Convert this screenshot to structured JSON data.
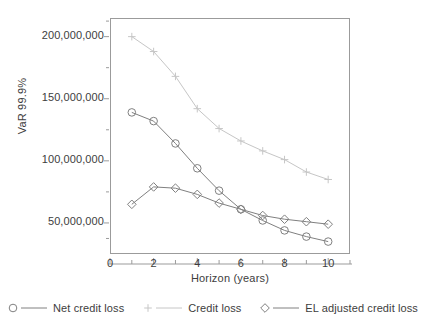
{
  "chart_data": {
    "type": "line",
    "title": "",
    "xlabel": "Horizon (years)",
    "ylabel": "VaR 99.9%",
    "x": [
      1,
      2,
      3,
      4,
      5,
      6,
      7,
      8,
      9,
      10
    ],
    "xlim": [
      0,
      11
    ],
    "ylim": [
      25000000,
      215000000
    ],
    "grid": false,
    "legend_position": "bottom",
    "xticks": [
      "0",
      "2",
      "4",
      "6",
      "8",
      "10"
    ],
    "xtick_values": [
      0,
      2,
      4,
      6,
      8,
      10
    ],
    "xminor_ticks": [
      1,
      3,
      5,
      7,
      9,
      11
    ],
    "yticks": [
      "50,000,000",
      "100,000,000",
      "150,000,000",
      "200,000,000"
    ],
    "ytick_values": [
      50000000,
      100000000,
      150000000,
      200000000
    ],
    "yminor_ticks": [
      37500000,
      75000000,
      125000000,
      175000000,
      212500000
    ],
    "series": [
      {
        "name": "Net credit loss",
        "marker": "circle",
        "color": "#808080",
        "values": [
          139000000,
          132000000,
          114000000,
          94000000,
          76000000,
          61000000,
          52000000,
          44000000,
          39000000,
          35000000
        ]
      },
      {
        "name": "Credit loss",
        "marker": "plus",
        "color": "#c6c6c6",
        "values": [
          200000000,
          188000000,
          168000000,
          142000000,
          126000000,
          116000000,
          108000000,
          101000000,
          91000000,
          85000000
        ]
      },
      {
        "name": "EL adjusted credit loss",
        "marker": "diamond",
        "color": "#808080",
        "values": [
          65000000,
          79000000,
          78000000,
          73000000,
          66000000,
          61000000,
          56000000,
          53000000,
          51000000,
          49000000
        ]
      }
    ]
  },
  "axes": {
    "x_title": "Horizon (years)",
    "y_title": "VaR 99.9%"
  },
  "legend": {
    "items": [
      {
        "label": "Net credit loss",
        "marker": "circle-marker-icon"
      },
      {
        "label": "Credit loss",
        "marker": "plus-marker-icon"
      },
      {
        "label": "EL adjusted credit loss",
        "marker": "diamond-marker-icon"
      }
    ]
  },
  "colors": {
    "line_dark": "#808080",
    "line_light": "#c6c6c6",
    "axis": "#9b9b9b",
    "text": "#3d3d3d"
  }
}
